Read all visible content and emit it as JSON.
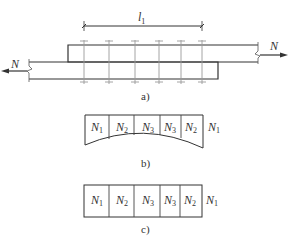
{
  "figure": {
    "panel_a": {
      "caption": "a)",
      "dimension_label": "l",
      "dimension_sub": "1",
      "left_force": "N",
      "right_force": "N",
      "bolt_columns": 6
    },
    "panel_b": {
      "caption": "b)",
      "cells": [
        {
          "base": "N",
          "sub": "1"
        },
        {
          "base": "N",
          "sub": "2"
        },
        {
          "base": "N",
          "sub": "3"
        },
        {
          "base": "N",
          "sub": "3"
        },
        {
          "base": "N",
          "sub": "2"
        }
      ],
      "outer_label": {
        "base": "N",
        "sub": "1"
      }
    },
    "panel_c": {
      "caption": "c)",
      "cells": [
        {
          "base": "N",
          "sub": "1"
        },
        {
          "base": "N",
          "sub": "2"
        },
        {
          "base": "N",
          "sub": "3"
        },
        {
          "base": "N",
          "sub": "3"
        },
        {
          "base": "N",
          "sub": "2"
        }
      ],
      "outer_label": {
        "base": "N",
        "sub": "1"
      }
    },
    "colors": {
      "line": "#333333",
      "bolt_line": "#9a9a9a",
      "text": "#333333"
    }
  }
}
